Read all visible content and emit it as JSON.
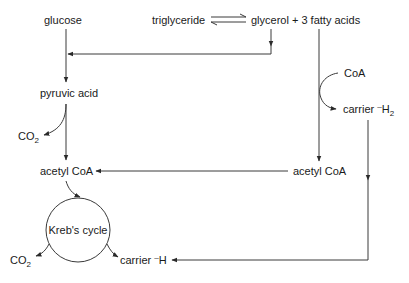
{
  "diagram": {
    "type": "metabolic-pathway",
    "colors": {
      "ink": "#1a1a1a",
      "line": "#3a3a3a",
      "background": "#ffffff"
    },
    "nodes": {
      "glucose": "glucose",
      "triglyceride": "triglyceride",
      "glycerol_fatty_acids": "glycerol + 3 fatty acids",
      "pyruvic_acid": "pyruvic acid",
      "co2_top": {
        "main": "CO",
        "sub": "2"
      },
      "coa": "CoA",
      "carrier_h2": {
        "main": "carrier ",
        "sup": "–",
        "h": "H",
        "sub": "2"
      },
      "acetyl_coa_left": "acetyl CoA",
      "acetyl_coa_right": "acetyl CoA",
      "krebs_cycle": "Kreb's cycle",
      "co2_bottom": {
        "main": "CO",
        "sub": "2"
      },
      "carrier_h": {
        "main": "carrier ",
        "sup": "–",
        "h": "H"
      }
    },
    "edges": [
      {
        "from": "glucose",
        "to": "pyruvic acid"
      },
      {
        "from": "triglyceride",
        "to": "glycerol + 3 fatty acids",
        "type": "reversible"
      },
      {
        "from": "glycerol",
        "to": "glucose pathway"
      },
      {
        "from": "pyruvic acid",
        "to": "CO2"
      },
      {
        "from": "pyruvic acid",
        "to": "acetyl CoA"
      },
      {
        "from": "3 fatty acids",
        "to": "acetyl CoA (right)"
      },
      {
        "from": "CoA",
        "to": "carrier H2"
      },
      {
        "from": "acetyl CoA (right)",
        "to": "acetyl CoA (left)"
      },
      {
        "from": "acetyl CoA",
        "to": "Kreb's cycle"
      },
      {
        "from": "Kreb's cycle",
        "to": "CO2"
      },
      {
        "from": "Kreb's cycle",
        "to": "carrier H"
      },
      {
        "from": "carrier H2",
        "to": "carrier H"
      }
    ]
  }
}
